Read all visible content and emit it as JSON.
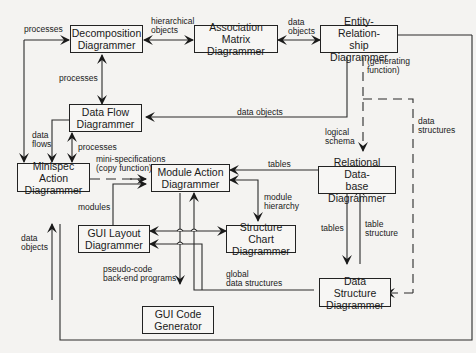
{
  "nodes": {
    "decomposition": {
      "line1": "Decomposition",
      "line2": "Diagrammer"
    },
    "association": {
      "line1": "Association",
      "line2": "Matrix Diagrammer"
    },
    "entity_relationship": {
      "line1": "Entity-Relation-",
      "line2": "ship Diagrammer"
    },
    "data_flow": {
      "line1": "Data Flow",
      "line2": "Diagrammer"
    },
    "minispec": {
      "line1": "Minispec Action",
      "line2": "Diagrammer"
    },
    "module_action": {
      "line1": "Module Action",
      "line2": "Diagrammer"
    },
    "relational_db": {
      "line1": "Relational Data-",
      "line2": "base Diagrammer"
    },
    "gui_layout": {
      "line1": "GUI Layout",
      "line2": "Diagrammer"
    },
    "structure_chart": {
      "line1": "Structure Chart",
      "line2": "Diagrammer"
    },
    "data_structure": {
      "line1": "Data Structure",
      "line2": "Diagrammer"
    },
    "gui_code": {
      "line1": "GUI Code",
      "line2": "Generator"
    }
  },
  "edge_labels": {
    "processes_top": "processes",
    "hierarchical_objects_1": "hierarchical",
    "hierarchical_objects_2": "objects",
    "data_objects_top_1": "data",
    "data_objects_top_2": "objects",
    "processes_mid": "processes",
    "generating_function_1": "(generating",
    "generating_function_2": "function)",
    "data_objects_er": "data objects",
    "data_flows_1": "data",
    "data_flows_2": "flows",
    "processes_low": "processes",
    "mini_spec_1": "mini-specifications",
    "mini_spec_2": "(copy function)",
    "logical_schema_1": "logical",
    "logical_schema_2": "schema",
    "data_structures_1": "data",
    "data_structures_2": "structures",
    "tables_top": "tables",
    "modules": "modules",
    "module_hierarchy_1": "module",
    "module_hierarchy_2": "hierarchy",
    "data_objects_left_1": "data",
    "data_objects_left_2": "objects",
    "tables_low": "tables",
    "table_structure_1": "table",
    "table_structure_2": "structure",
    "pseudo_code_1": "pseudo-code",
    "pseudo_code_2": "back-end programs",
    "global_ds_1": "global",
    "global_ds_2": "data structures"
  }
}
